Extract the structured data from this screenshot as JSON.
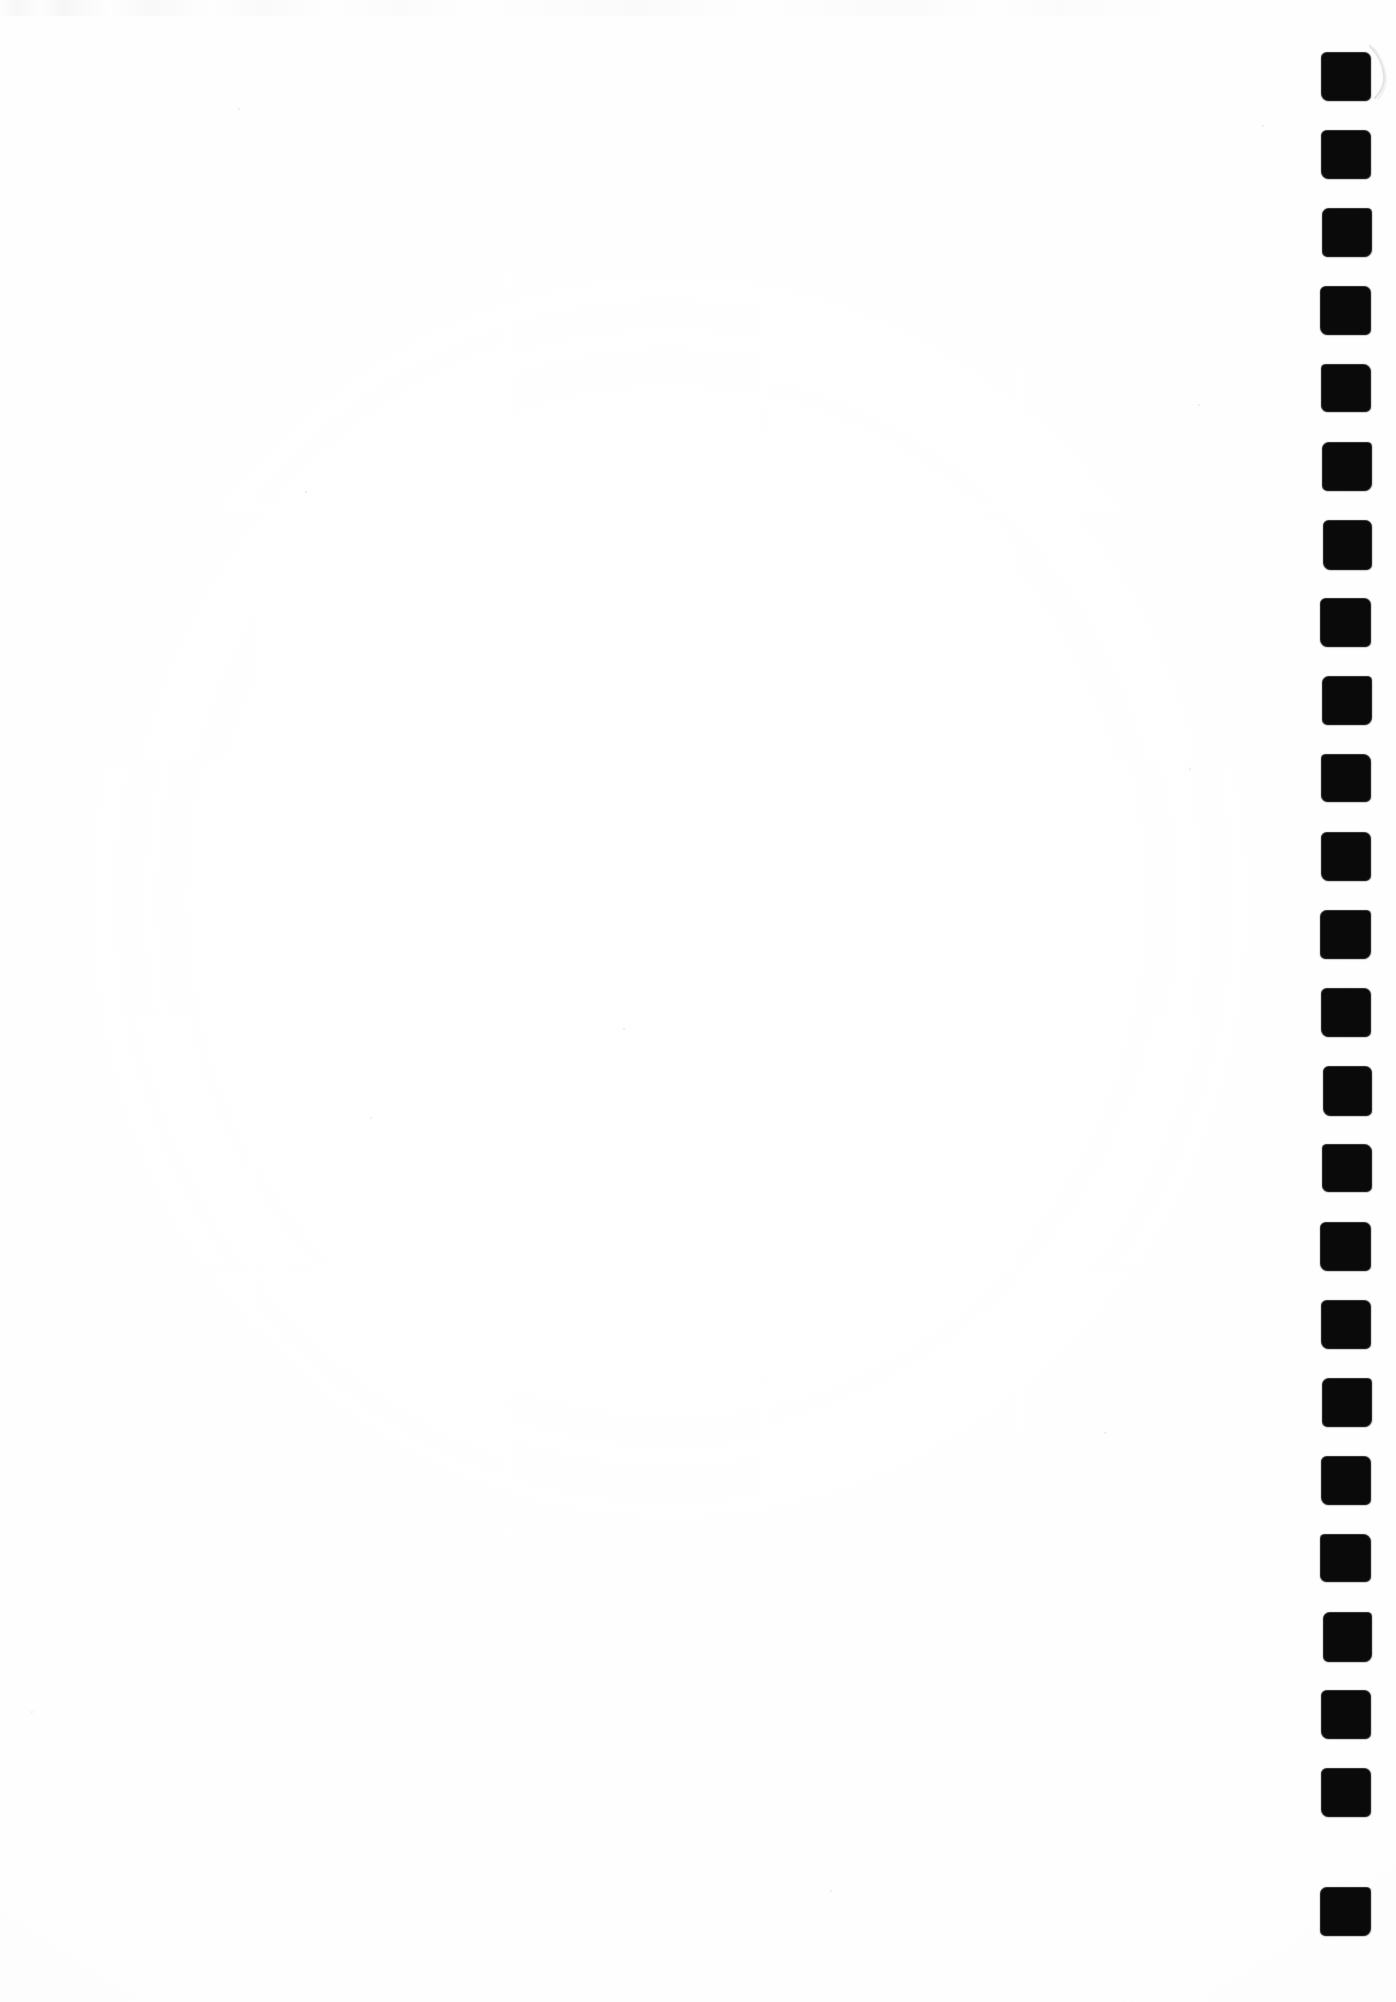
{
  "page": {
    "kind": "scanned-blank-page",
    "width": 1396,
    "height": 2002,
    "background_color": "#ffffff",
    "paper_tone_color": "#fdfdfd",
    "caption": ""
  },
  "margin_marks": {
    "name": "right-margin-index-marks",
    "ink_color": "#0a0a0a",
    "count": 24,
    "shape": "square",
    "mark_width": 48,
    "mark_height": 47,
    "column_left": 1322,
    "column_right": 1370,
    "first_top": 53,
    "pitch": 78,
    "label": "",
    "tops": [
      53,
      131,
      209,
      287,
      365,
      443,
      521,
      599,
      677,
      755,
      833,
      911,
      989,
      1067,
      1145,
      1223,
      1301,
      1379,
      1457,
      1535,
      1613,
      1691,
      1769,
      1888
    ]
  },
  "artifacts": {
    "brush_scuff": {
      "name": "brush-scuff-mark",
      "color": "#e6e6e8",
      "x": 1368,
      "y": 44,
      "width": 22,
      "height": 56
    },
    "scan_noise_band": {
      "name": "top-edge-scan-noise",
      "color": "#f3f3f5",
      "y": 0,
      "height": 16
    },
    "specks": [
      {
        "x": 238,
        "y": 108,
        "size": 2
      },
      {
        "x": 305,
        "y": 491,
        "size": 2
      },
      {
        "x": 1262,
        "y": 125,
        "size": 2
      },
      {
        "x": 623,
        "y": 1028,
        "size": 2
      },
      {
        "x": 370,
        "y": 1117,
        "size": 2
      },
      {
        "x": 1198,
        "y": 404,
        "size": 2
      },
      {
        "x": 31,
        "y": 1711,
        "size": 2
      },
      {
        "x": 1189,
        "y": 768,
        "size": 2
      },
      {
        "x": 830,
        "y": 1890,
        "size": 2
      },
      {
        "x": 1104,
        "y": 1432,
        "size": 2
      }
    ]
  }
}
